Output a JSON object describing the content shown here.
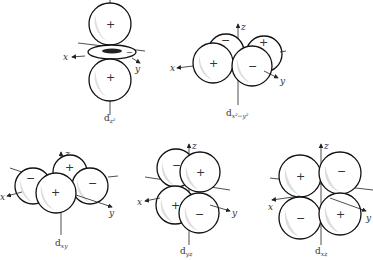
{
  "figure": {
    "axis_labels": {
      "x": "x",
      "y": "y",
      "z": "z"
    },
    "orbitals": [
      {
        "id": "dz2",
        "caption_main": "d",
        "caption_sub": "z²",
        "lobe_signs": [
          "+",
          "+"
        ],
        "ring_sign": "−"
      },
      {
        "id": "dx2-y2",
        "caption_main": "d",
        "caption_sub": "x²−y²",
        "lobe_signs": [
          "−",
          "+",
          "+",
          "−"
        ]
      },
      {
        "id": "dxy",
        "caption_main": "d",
        "caption_sub": "xy",
        "lobe_signs": [
          "−",
          "+",
          "+",
          "−"
        ]
      },
      {
        "id": "dyz",
        "caption_main": "d",
        "caption_sub": "yz",
        "lobe_signs": [
          "−",
          "+",
          "+",
          "−"
        ]
      },
      {
        "id": "dxz",
        "caption_main": "d",
        "caption_sub": "xz",
        "lobe_signs": [
          "+",
          "−",
          "−",
          "+"
        ]
      }
    ]
  }
}
